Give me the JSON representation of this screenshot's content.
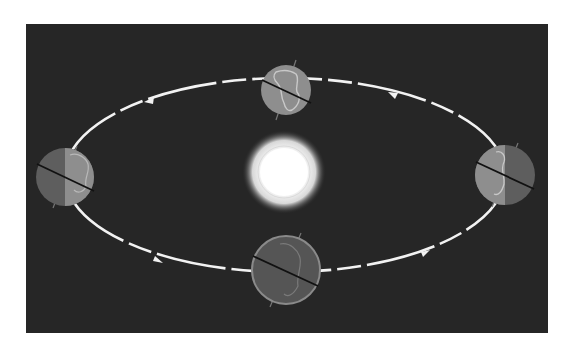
{
  "diagram": {
    "title": "",
    "type": "earth-orbit-seasons",
    "colors": {
      "page_background": "#ffffff",
      "panel_background": "#262626",
      "orbit_line": "#f2f2f2",
      "earth_lit": "#8e8e8e",
      "earth_dark": "#5e5e5e",
      "continent_outline": "#c8c8c8",
      "axis_line": "#111111",
      "sun_core": "#ffffff",
      "sun_glow": "#bdbdbd"
    },
    "panel": {
      "x": 26,
      "y": 24,
      "width": 522,
      "height": 309
    },
    "orbit": {
      "cx": 285,
      "cy": 175,
      "rx": 220,
      "ry": 97,
      "direction": "counterclockwise"
    },
    "sun": {
      "label": "sun",
      "cx": 284,
      "cy": 172,
      "core_r": 26,
      "glow_r": 42
    },
    "earths": [
      {
        "name": "earth-top",
        "cx": 286,
        "cy": 90,
        "r": 25,
        "lit": "full",
        "axis_tilt_deg": 28
      },
      {
        "name": "earth-left",
        "cx": 65,
        "cy": 177,
        "r": 29,
        "lit": "right-half",
        "axis_tilt_deg": 28
      },
      {
        "name": "earth-right",
        "cx": 505,
        "cy": 175,
        "r": 30,
        "lit": "left-half",
        "axis_tilt_deg": 28
      },
      {
        "name": "earth-bottom",
        "cx": 286,
        "cy": 270,
        "r": 34,
        "lit": "none",
        "axis_tilt_deg": 28
      }
    ],
    "arrows": [
      {
        "name": "arrow-top-left",
        "x": 148,
        "y": 101,
        "dir": "left"
      },
      {
        "name": "arrow-top-right",
        "x": 390,
        "y": 93,
        "dir": "left"
      },
      {
        "name": "arrow-bottom-left",
        "x": 160,
        "y": 262,
        "dir": "right"
      },
      {
        "name": "arrow-bottom-right",
        "x": 430,
        "y": 251,
        "dir": "right"
      }
    ]
  }
}
